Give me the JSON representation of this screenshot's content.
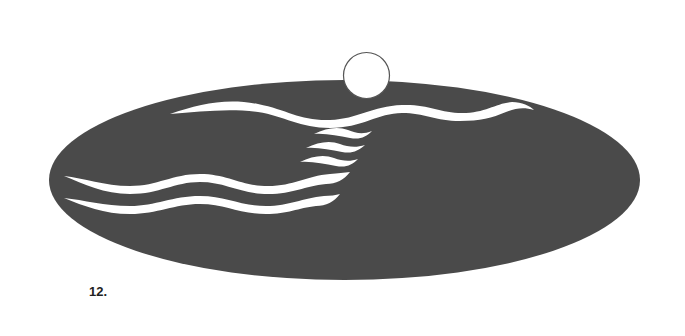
{
  "figure": {
    "caption": "12.",
    "colors": {
      "ellipse_fill": "#4a4a4a",
      "wave_fill": "#ffffff",
      "sun_fill": "#ffffff",
      "sun_stroke": "#555555",
      "background": "#ffffff"
    }
  }
}
